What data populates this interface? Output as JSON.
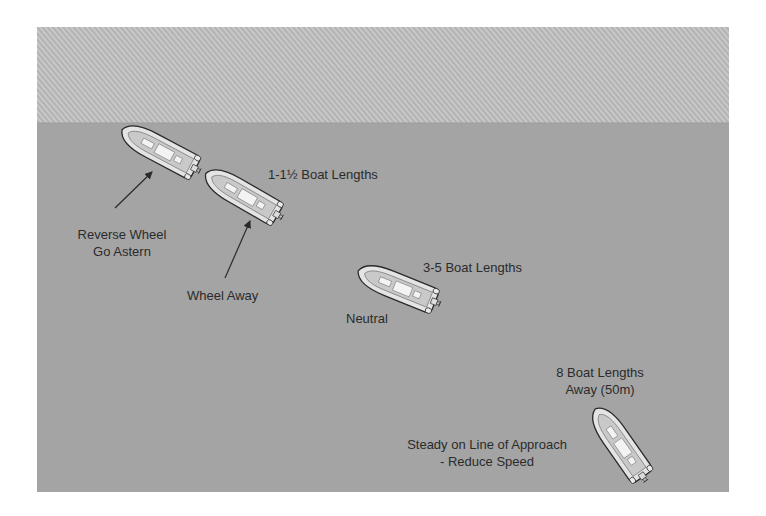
{
  "diagram": {
    "colors": {
      "shore": "#b4b4b4",
      "shore_hatch": "#c6c6c6",
      "water": "#a3a3a3",
      "boat_hull": "#e2e2e2",
      "boat_outline": "#2a2a2a",
      "text": "#2b2b2b"
    },
    "regions": {
      "shore": {
        "label": "shore (hatched)",
        "x": 37,
        "y": 27,
        "w": 692,
        "h": 96
      },
      "water": {
        "label": "water",
        "x": 37,
        "y": 123,
        "w": 692,
        "h": 369
      }
    },
    "boats": [
      {
        "id": "boat-1",
        "cx": 160,
        "cy": 150,
        "angle": 28
      },
      {
        "id": "boat-2",
        "cx": 243,
        "cy": 195,
        "angle": 30
      },
      {
        "id": "boat-3",
        "cx": 398,
        "cy": 287,
        "angle": 22
      },
      {
        "id": "boat-4",
        "cx": 620,
        "cy": 444,
        "angle": 55
      }
    ],
    "labels": {
      "step1_distance": "1-1½  Boat Lengths",
      "step1_action_line1": "Reverse Wheel",
      "step1_action_line2": "Go Astern",
      "step2_action": "Wheel Away",
      "step3_distance": "3-5 Boat Lengths",
      "step3_action": "Neutral",
      "step4_distance_line1": "8 Boat Lengths",
      "step4_distance_line2": "Away (50m)",
      "step4_action_line1": "Steady on Line of Approach",
      "step4_action_line2": "- Reduce Speed"
    },
    "arrows": [
      {
        "id": "arrow-reverse",
        "x1": 115,
        "y1": 208,
        "x2": 152,
        "y2": 172
      },
      {
        "id": "arrow-wheel-away",
        "x1": 225,
        "y1": 278,
        "x2": 250,
        "y2": 221
      }
    ]
  }
}
